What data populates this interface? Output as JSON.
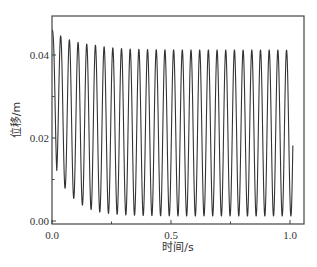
{
  "chart_data": {
    "type": "line",
    "title": "",
    "xlabel": "时间/s",
    "ylabel": "位移/m",
    "xlim": [
      0.0,
      1.06
    ],
    "ylim": [
      0.0,
      0.0494
    ],
    "x_ticks": [
      0.0,
      0.5,
      1.0
    ],
    "x_tick_labels": [
      "0.0",
      "0.5",
      "1.0"
    ],
    "x_minor_ticks": [
      0.25,
      0.75
    ],
    "y_ticks": [
      0.0,
      0.02,
      0.04
    ],
    "y_tick_labels": [
      "0.00",
      "0.02",
      "0.04"
    ],
    "y_minor_ticks": [
      0.01,
      0.03
    ],
    "grid": false,
    "legend": null,
    "series": [
      {
        "name": "位移",
        "color": "#333333",
        "description": "Damped-to-steady oscillation: starts at ~0.046 m, first trough ~0.015 m at t≈0.04 s, then mean drifts to ~0.021 m with amplitude growing to ~0.020 m; peaks settle at ~0.041 m, troughs fall to ~0.001 m; curve ends at t≈1.01 s around 0.012 m.",
        "model": {
          "t_start": 0.0,
          "t_end": 1.012,
          "y0": 0.046,
          "period": 0.0365,
          "steady_mean": 0.0212,
          "steady_amplitude": 0.02,
          "initial_mean": 0.03,
          "initial_amplitude": 0.016,
          "settle_tau": 0.09
        },
        "key_points": [
          {
            "t": 0.0,
            "y": 0.046
          },
          {
            "t": 0.04,
            "y": 0.015
          },
          {
            "t": 0.065,
            "y": 0.04
          },
          {
            "t": 0.095,
            "y": 0.009
          },
          {
            "t": 0.155,
            "y": 0.04
          },
          {
            "t": 0.18,
            "y": 0.0045
          },
          {
            "t": 0.3,
            "y": 0.0415
          },
          {
            "t": 0.32,
            "y": 0.002
          },
          {
            "t": 0.5,
            "y": 0.0415
          },
          {
            "t": 0.52,
            "y": 0.0012
          },
          {
            "t": 1.0,
            "y": 0.041
          },
          {
            "t": 1.012,
            "y": 0.012
          }
        ]
      }
    ]
  }
}
